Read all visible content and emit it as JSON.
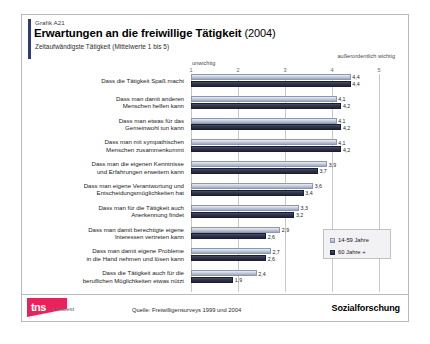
{
  "header": {
    "graphic_id": "Grafik A21",
    "title": "Erwartungen an die freiwillige Tätigkeit",
    "title_year": "(2004)",
    "subtitle": "Zeitaufwändigste Tätigkeit (Mittelwerte 1 bis 5)"
  },
  "legend": {
    "series_0": "14-59 Jahre",
    "series_1": "60 Jahre +"
  },
  "footer": {
    "logo_tns": "tns",
    "logo_infratest": "infratest",
    "source": "Quelle: Freiwilligensurveys 1999 und 2004",
    "division": "Sozialforschung"
  },
  "colors": {
    "accent": "#2e3d73",
    "series_0": "#ccd3e0",
    "series_1": "#31354a",
    "logo_red": "#e8225a",
    "grid": "#c8c8cc"
  },
  "chart_data": {
    "type": "bar",
    "orientation": "horizontal",
    "title": "Erwartungen an die freiwillige Tätigkeit (2004)",
    "subtitle": "Zeitaufwändigste Tätigkeit (Mittelwerte 1 bis 5)",
    "xlabel": "",
    "ylabel": "",
    "xlim": [
      1,
      5
    ],
    "xticks": [
      1,
      2,
      3,
      4,
      5
    ],
    "xtick_labels": [
      "1",
      "2",
      "3",
      "4",
      "5"
    ],
    "axis_low_caption": "unwichtig",
    "axis_high_caption": "außerordentlich\nwichtig",
    "grid": true,
    "legend_position": "right-inside",
    "categories": [
      "Dass die Tätigkeit Spaß macht",
      "Dass man damit anderen\nMenschen helfen kann",
      "Dass man etwas für das\nGemeinwohl tun kann",
      "Dass  man mit sympathischen\nMenschen zusammenkommt",
      "Dass man die eigenen Kenntnisse\nund Erfahrungen erweitern kann",
      "Dass man eigene Verantwortung und\nEntscheidungsmöglichkeiten hat",
      "Dass man für die Tätigkeit auch\nAnerkennung findet",
      "Dass man damit berechtigte eigene\nInteressen vertreten kann",
      "Dass man damit eigene Probleme\nin die Hand nehmen und lösen kann",
      "Dass die Tätigkeit auch für die\nberuflichen Möglichkeiten etwas nützt"
    ],
    "series": [
      {
        "name": "14-59 Jahre",
        "values": [
          4.4,
          4.1,
          4.1,
          4.1,
          3.9,
          3.6,
          3.3,
          2.9,
          2.7,
          2.4
        ],
        "labels": [
          "4,4",
          "4,1",
          "4,1",
          "4,1",
          "3,9",
          "3,6",
          "3,3",
          "2,9",
          "2,7",
          "2,4"
        ]
      },
      {
        "name": "60 Jahre +",
        "values": [
          4.4,
          4.2,
          4.2,
          4.2,
          3.7,
          3.4,
          3.2,
          2.6,
          2.6,
          1.9
        ],
        "labels": [
          "4,4",
          "4,2",
          "4,2",
          "4,2",
          "3,7",
          "3,4",
          "3,2",
          "2,6",
          "2,6",
          "1,9"
        ]
      }
    ]
  }
}
